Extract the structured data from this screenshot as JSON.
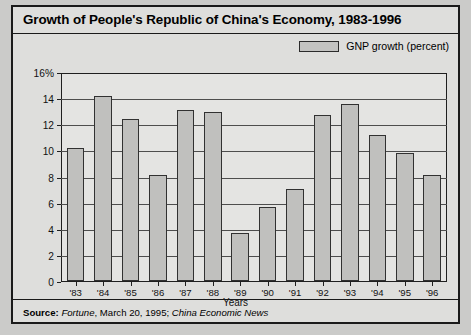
{
  "figure": {
    "title": "Growth of People's Republic of China's Economy, 1983-1996",
    "xaxis_title": "Years",
    "legend_label": "GNP growth (percent)",
    "source": {
      "label": "Source:",
      "publication_1": "Fortune",
      "middle": ", March 20, 1995; ",
      "publication_2": "China Economic News"
    },
    "colors": {
      "panel_background": "#dededc",
      "plot_background": "#e4e4e2",
      "bar_fill": "#c0c0be",
      "bar_outline": "#313131",
      "border": "#1a1a1a",
      "gridline": "#4d4d4d"
    }
  },
  "chart_data": {
    "type": "bar",
    "title": "Growth of People's Republic of China's Economy, 1983-1996",
    "xlabel": "Years",
    "ylabel": "",
    "ylim": [
      0,
      16
    ],
    "yticks": [
      0,
      2,
      4,
      6,
      8,
      10,
      12,
      14,
      16
    ],
    "ytick_labels": [
      "0",
      "2",
      "4",
      "6",
      "8",
      "10",
      "12",
      "14",
      "16%"
    ],
    "grid": true,
    "legend": [
      "GNP growth (percent)"
    ],
    "legend_position": "top-right",
    "categories": [
      "'83",
      "'84",
      "'85",
      "'86",
      "'87",
      "'88",
      "'89",
      "'90",
      "'91",
      "'92",
      "'93",
      "'94",
      "'95",
      "'96"
    ],
    "values": [
      10.3,
      14.3,
      12.5,
      8.2,
      13.2,
      13.1,
      3.7,
      5.7,
      7.1,
      12.8,
      13.7,
      11.3,
      9.9,
      8.2
    ]
  }
}
